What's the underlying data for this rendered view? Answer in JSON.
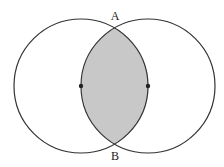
{
  "diagram": {
    "type": "two-circle-intersection",
    "circles": [
      {
        "name": "left",
        "cx": 81,
        "cy": 86,
        "r": 67
      },
      {
        "name": "right",
        "cx": 148,
        "cy": 86,
        "r": 67
      }
    ],
    "intersection_points": [
      {
        "label": "A",
        "x": 115,
        "y": 28
      },
      {
        "label": "B",
        "x": 115,
        "y": 144
      }
    ],
    "centers_marked": true,
    "shaded_region": "lens",
    "colors": {
      "stroke": "#333333",
      "shade": "#c8c8c8",
      "background": "#ffffff"
    }
  },
  "labels": {
    "a": "A",
    "b": "B"
  }
}
